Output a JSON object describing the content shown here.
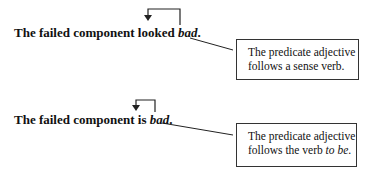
{
  "examples": [
    {
      "sentence": {
        "prefix": "The failed component looked ",
        "predicate_adjective": "bad",
        "suffix": "."
      },
      "callout": {
        "line1": "The predicate adjective",
        "line2_prefix": "follows a sense verb.",
        "line2_italic": "",
        "line2_suffix": ""
      }
    },
    {
      "sentence": {
        "prefix": "The failed component is ",
        "predicate_adjective": "bad",
        "suffix": "."
      },
      "callout": {
        "line1": "The predicate adjective",
        "line2_prefix": "follows the verb ",
        "line2_italic": "to be",
        "line2_suffix": "."
      }
    }
  ],
  "colors": {
    "text": "#111111",
    "line": "#222222",
    "background": "#ffffff"
  }
}
